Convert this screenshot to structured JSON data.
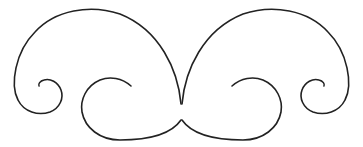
{
  "figure": {
    "width": 363,
    "height": 147,
    "background": "#ffffff",
    "stroke_color": "#222222",
    "stroke_width": 1.6
  },
  "shapes": [
    {
      "name": "left-scroll",
      "outer_arc": "M 181 104 C 178 70 160 30 120 14 C 90 4 55 10 35 32 C 15 52 10 85 18 100 C 24 112 38 116 50 112 C 60 108 64 98 61 90 C 58 82 50 78 44 80 C 40 81 38 84 39 86",
      "inner_spiral": "M 131 86 C 122 78 110 76 100 80 C 86 86 80 100 82 112 C 85 128 100 140 120 140 C 145 140 170 136 181 120"
    },
    {
      "name": "right-scroll",
      "outer_arc": "M 182 104 C 185 70 203 30 243 14 C 273 4 308 10 328 32 C 348 52 353 85 345 100 C 339 112 325 116 313 112 C 303 108 299 98 302 90 C 305 82 313 78 319 80 C 323 81 325 84 324 86",
      "inner_spiral": "M 232 86 C 241 78 253 76 263 80 C 277 86 283 100 281 112 C 278 128 263 140 243 140 C 218 140 193 136 182 120"
    }
  ]
}
